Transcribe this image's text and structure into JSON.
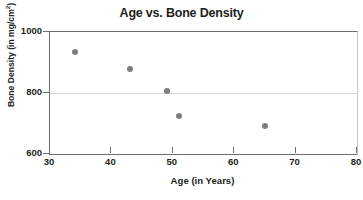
{
  "chart_data": {
    "type": "scatter",
    "title": "Age vs. Bone Density",
    "xlabel": "Age (in Years)",
    "ylabel_text": "Bone Density (in mg/cm",
    "ylabel_sup": "2",
    "ylabel_tail": ")",
    "xlim": [
      30,
      80
    ],
    "ylim": [
      600,
      1000
    ],
    "xticks": [
      30,
      40,
      50,
      60,
      70,
      80
    ],
    "yticks": [
      600,
      800,
      1000
    ],
    "gridlines": [
      800
    ],
    "grid": "horizontal-at-800-only",
    "legend": "none",
    "point_color": "#7d7d7d",
    "axis_color": "#6e6e6e",
    "grid_color": "#d9d9d9",
    "points": [
      {
        "x": 34,
        "y": 935,
        "label": "point-1"
      },
      {
        "x": 43,
        "y": 878,
        "label": "point-2"
      },
      {
        "x": 49,
        "y": 806,
        "label": "point-3"
      },
      {
        "x": 51,
        "y": 725,
        "label": "point-4"
      },
      {
        "x": 65,
        "y": 693,
        "label": "point-5"
      }
    ]
  }
}
